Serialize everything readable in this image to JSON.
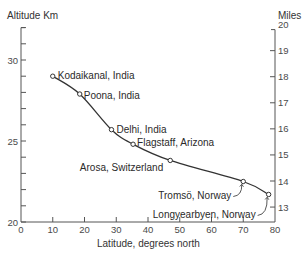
{
  "chart_data": {
    "type": "line",
    "title": "",
    "xlabel": "Latitude, degrees north",
    "ylabel": "Altitude Km",
    "ylabel_right": "Miles",
    "xlim": [
      0,
      80
    ],
    "ylim": [
      20,
      32
    ],
    "ylim_right_miles": [
      13,
      20
    ],
    "x_ticks": [
      0,
      10,
      20,
      30,
      40,
      50,
      60,
      70,
      80
    ],
    "y_ticks_major": [
      20,
      25,
      30
    ],
    "y_ticks_minor_step": 1,
    "y_right_ticks": [
      13,
      14,
      15,
      16,
      17,
      18,
      19,
      20
    ],
    "grid": false,
    "legend": null,
    "series": [
      {
        "name": "Tropopause altitude",
        "points": [
          {
            "label": "Kodaikanal, India",
            "lat": 10,
            "alt_km": 29.0
          },
          {
            "label": "Poona, India",
            "lat": 18.5,
            "alt_km": 27.9
          },
          {
            "label": "Delhi, India",
            "lat": 28.5,
            "alt_km": 25.7
          },
          {
            "label": "Flagstaff, Arizona",
            "lat": 35.3,
            "alt_km": 24.8
          },
          {
            "label": "Arosa, Switzerland",
            "lat": 47,
            "alt_km": 23.8
          },
          {
            "label": "Tromsö, Norway",
            "lat": 70,
            "alt_km": 22.5
          },
          {
            "label": "Longyearbyen, Norway",
            "lat": 78,
            "alt_km": 21.7
          }
        ]
      }
    ]
  },
  "labels": {
    "y_left_title": "Altitude Km",
    "y_right_title": "Miles",
    "x_title": "Latitude, degrees north"
  }
}
